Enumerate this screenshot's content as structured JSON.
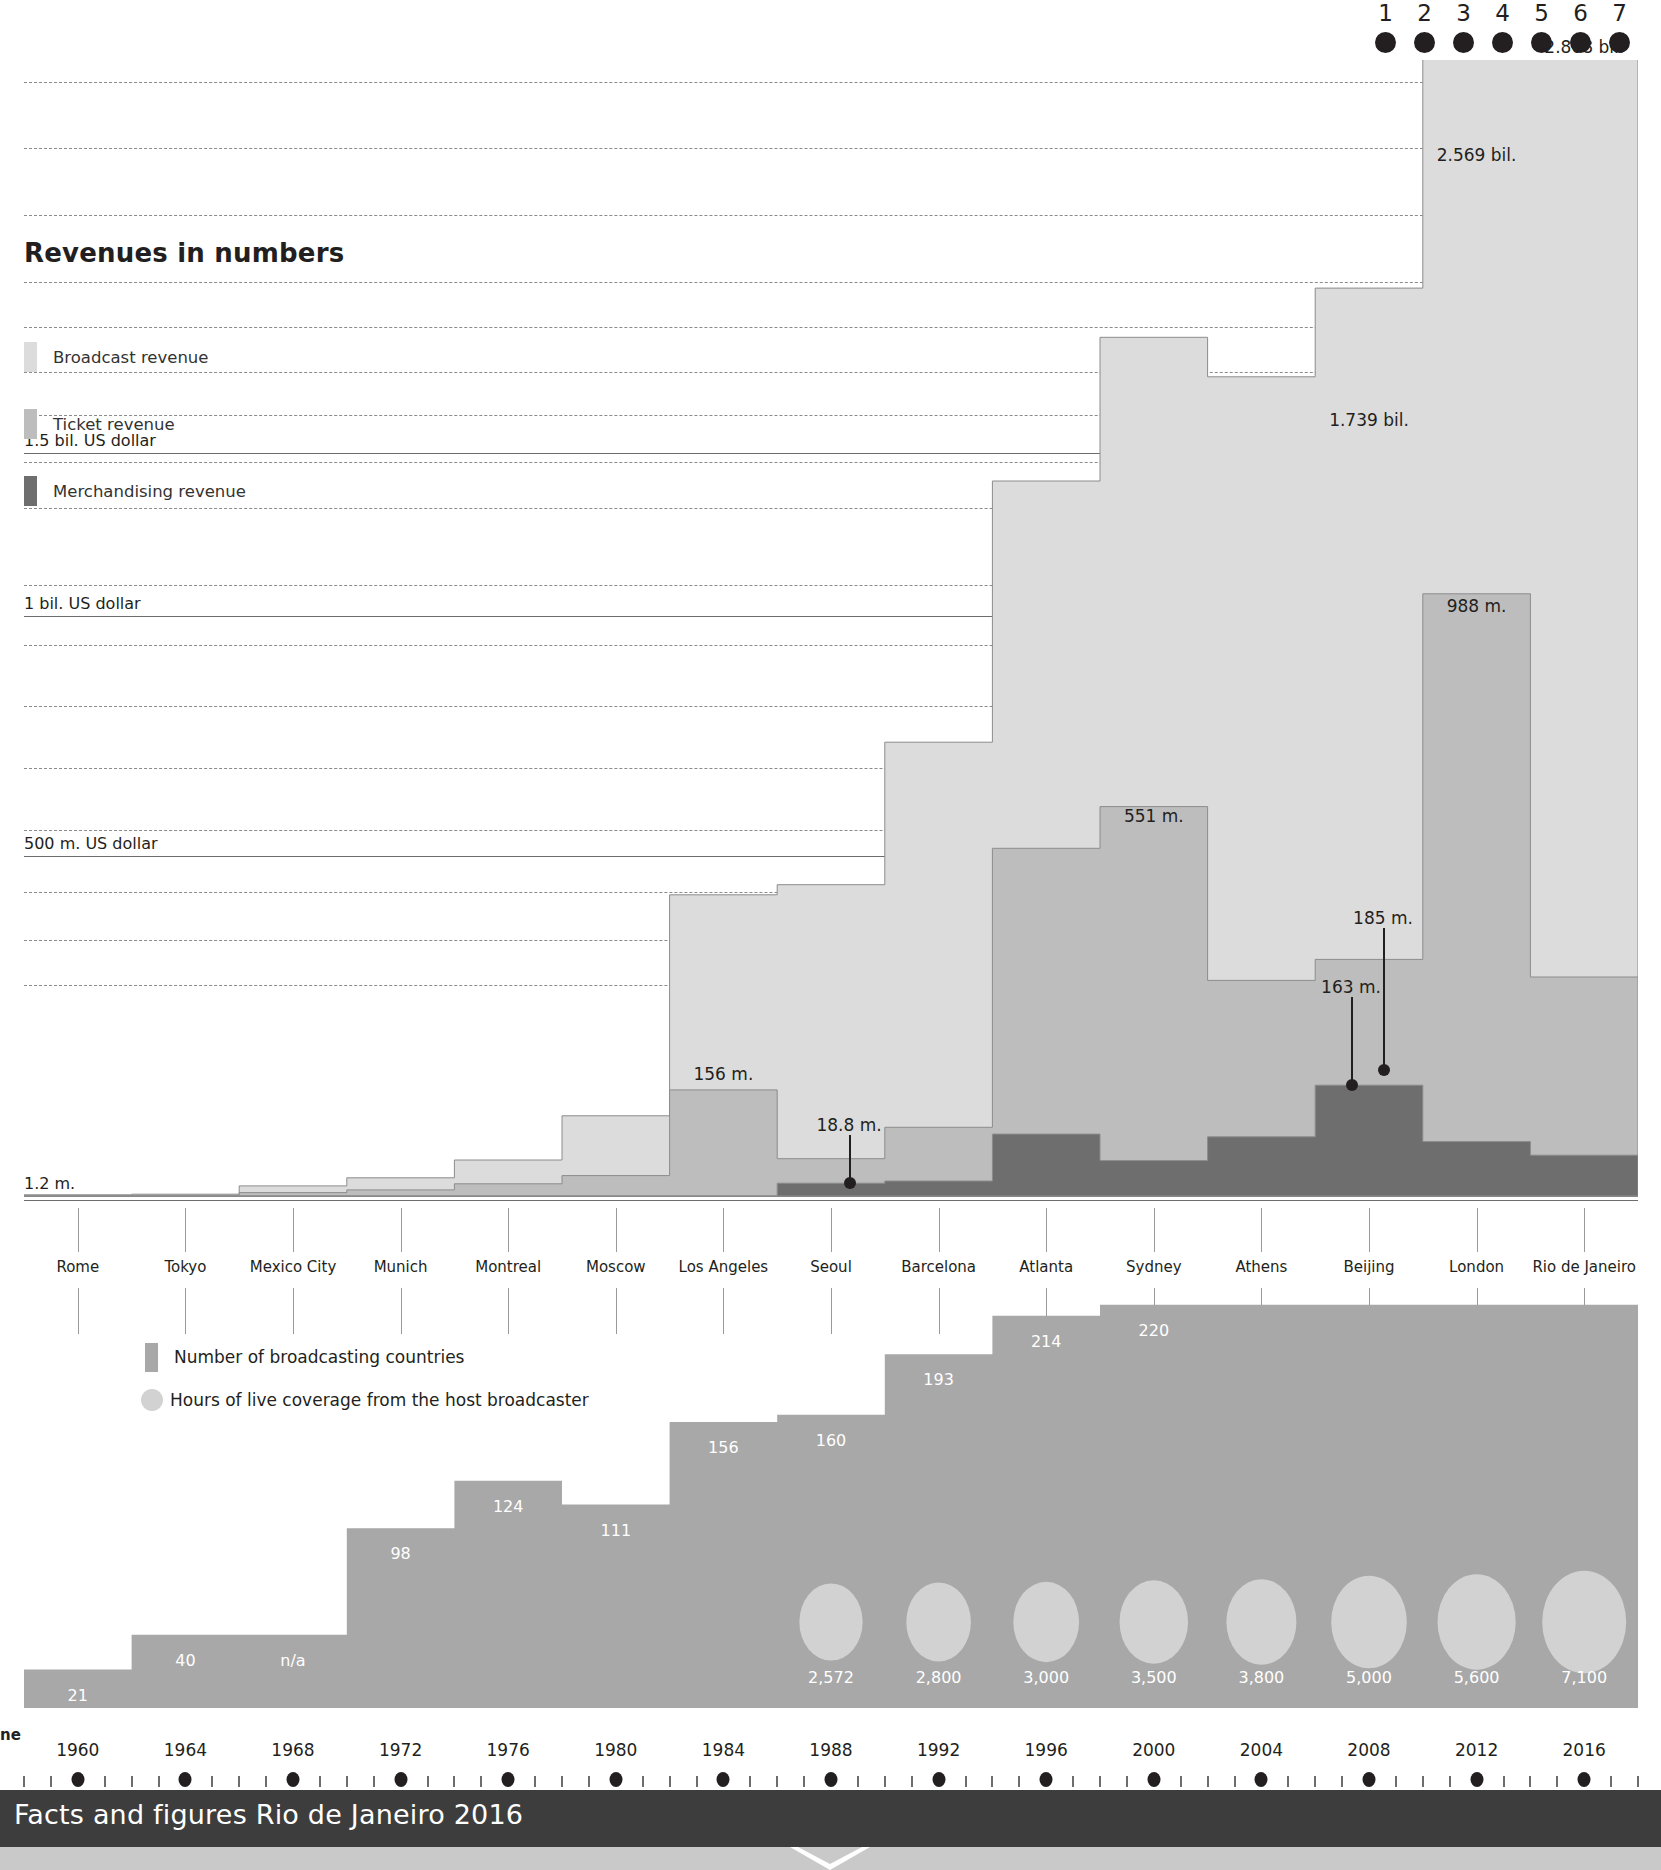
{
  "page_dots": {
    "numbers": [
      "1",
      "2",
      "3",
      "4",
      "5",
      "6",
      "7"
    ],
    "active_index": 6
  },
  "revenue_section": {
    "title": "Revenues in numbers",
    "legend": [
      {
        "label": "Broadcast revenue",
        "color": "#dcdcdc"
      },
      {
        "label": "Ticket revenue",
        "color": "#bdbdbd"
      },
      {
        "label": "Merchandising revenue",
        "color": "#6e6e6e"
      }
    ],
    "axis_labels": [
      {
        "text": "1.5 bil. US dollar",
        "value": 1500
      },
      {
        "text": "1 bil. US dollar",
        "value": 1000
      },
      {
        "text": "500 m. US dollar",
        "value": 500
      },
      {
        "text": "1.2 m.",
        "value": 1.2
      }
    ]
  },
  "lower_section": {
    "legend": [
      {
        "label": "Number of broadcasting countries",
        "color": "#a8a8a8"
      },
      {
        "label": "Hours of live coverage from the host broadcaster",
        "color": "#d2d2d2"
      }
    ]
  },
  "cities": [
    "Rome",
    "Tokyo",
    "Mexico City",
    "Munich",
    "Montreal",
    "Moscow",
    "Los Angeles",
    "Seoul",
    "Barcelona",
    "Atlanta",
    "Sydney",
    "Athens",
    "Beijing",
    "London",
    "Rio de Janeiro"
  ],
  "years": [
    "1960",
    "1964",
    "1968",
    "1972",
    "1976",
    "1980",
    "1984",
    "1988",
    "1992",
    "1996",
    "2000",
    "2004",
    "2008",
    "2012",
    "2016"
  ],
  "footer": {
    "title": "Facts and figures Rio de Janeiro 2016",
    "left_cut_label": "ne"
  },
  "chart_data": [
    {
      "type": "area",
      "title": "Revenues in numbers",
      "ylabel": "US dollar",
      "xlabel": "",
      "grid": true,
      "ylim": [
        0,
        3000
      ],
      "x": [
        "Rome",
        "Tokyo",
        "Mexico City",
        "Munich",
        "Montreal",
        "Moscow",
        "Los Angeles",
        "Seoul",
        "Barcelona",
        "Atlanta",
        "Sydney",
        "Athens",
        "Beijing",
        "London",
        "Rio de Janeiro"
      ],
      "categories": [
        "1960",
        "1964",
        "1968",
        "1972",
        "1976",
        "1980",
        "1984",
        "1988",
        "1992",
        "1996",
        "2000",
        "2004",
        "2008",
        "2012",
        "2016"
      ],
      "series": [
        {
          "name": "Broadcast revenue",
          "color": "#dcdcdc",
          "values": [
            1.2,
            1.6,
            9.8,
            17.8,
            34.9,
            88,
            287,
            403,
            636,
            898,
            1331,
            1494,
            1739,
            2569,
            2868
          ]
        },
        {
          "name": "Ticket revenue",
          "color": "#bdbdbd",
          "values": [
            0.5,
            1.0,
            5,
            9,
            18,
            30,
            156,
            36,
            79,
            425,
            551,
            230,
            185,
            988,
            262
          ]
        },
        {
          "name": "Merchandising revenue",
          "color": "#6e6e6e",
          "values": [
            0,
            0,
            0,
            0,
            0,
            0,
            0,
            18.8,
            22,
            91,
            52,
            87,
            163,
            80,
            60
          ]
        }
      ],
      "annotations": [
        {
          "text": "2.868 bil.",
          "x": "Rio de Janeiro",
          "value": 2868
        },
        {
          "text": "2.569 bil.",
          "x": "London",
          "value": 2569
        },
        {
          "text": "1.739 bil.",
          "x": "Beijing",
          "value": 1739
        },
        {
          "text": "988 m.",
          "x": "London",
          "value": 988
        },
        {
          "text": "551 m.",
          "x": "Sydney",
          "value": 551
        },
        {
          "text": "185 m.",
          "x": "Beijing",
          "value": 185
        },
        {
          "text": "163 m.",
          "x": "Beijing",
          "value": 163
        },
        {
          "text": "156 m.",
          "x": "Los Angeles",
          "value": 156
        },
        {
          "text": "18.8 m.",
          "x": "Seoul",
          "value": 18.8
        },
        {
          "text": "1.2 m.",
          "x": "Rome",
          "value": 1.2
        }
      ]
    },
    {
      "type": "area",
      "title": "Number of broadcasting countries",
      "ylabel": "countries",
      "xlabel": "",
      "grid": false,
      "categories": [
        "1960",
        "1964",
        "1968",
        "1972",
        "1976",
        "1980",
        "1984",
        "1988",
        "1992",
        "1996",
        "2000",
        "2004",
        "2008",
        "2012",
        "2016"
      ],
      "x": [
        "Rome",
        "Tokyo",
        "Mexico City",
        "Munich",
        "Montreal",
        "Moscow",
        "Los Angeles",
        "Seoul",
        "Barcelona",
        "Atlanta",
        "Sydney",
        "Athens",
        "Beijing",
        "London",
        "Rio de Janeiro"
      ],
      "values": [
        21,
        40,
        null,
        98,
        124,
        111,
        156,
        160,
        193,
        214,
        220,
        220,
        220,
        220,
        220
      ],
      "value_labels": [
        "21",
        "40",
        "n/a",
        "98",
        "124",
        "111",
        "156",
        "160",
        "193",
        "214",
        "220",
        "",
        "",
        "",
        ""
      ]
    },
    {
      "type": "scatter",
      "title": "Hours of live coverage from the host broadcaster",
      "x": [
        "Seoul",
        "Barcelona",
        "Atlanta",
        "Sydney",
        "Athens",
        "Beijing",
        "London",
        "Rio de Janeiro"
      ],
      "categories": [
        "1988",
        "1992",
        "1996",
        "2000",
        "2004",
        "2008",
        "2012",
        "2016"
      ],
      "values": [
        2572,
        2800,
        3000,
        3500,
        3800,
        5000,
        5600,
        7100
      ],
      "value_labels": [
        "2,572",
        "2,800",
        "3,000",
        "3,500",
        "3,800",
        "5,000",
        "5,600",
        "7,100"
      ]
    }
  ]
}
